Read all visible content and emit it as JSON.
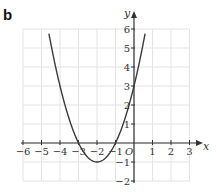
{
  "panel": {
    "label": "b"
  },
  "chart_data": {
    "type": "line",
    "title": "",
    "xlabel": "x",
    "ylabel": "y",
    "origin_label": "O",
    "xlim": [
      -6,
      3
    ],
    "ylim": [
      -2,
      6
    ],
    "grid": true,
    "x_ticks": [
      -6,
      -5,
      -4,
      -3,
      -2,
      -1,
      1,
      2,
      3
    ],
    "x_tick_labels": [
      "−6",
      "−5",
      "−4",
      "−3",
      "−2",
      "−1",
      "1",
      "2",
      "3"
    ],
    "y_ticks": [
      -2,
      -1,
      1,
      2,
      3,
      4,
      5,
      6
    ],
    "y_tick_labels": [
      "−2",
      "−1",
      "1",
      "2",
      "3",
      "4",
      "5",
      "6"
    ],
    "series": [
      {
        "name": "y = x² + 4x + 3",
        "expression": "x^2 + 4x + 3",
        "x_range": [
          -4.6,
          0.6
        ],
        "points": [
          [
            -4.6,
            5.76
          ],
          [
            -4.5,
            5.25
          ],
          [
            -4,
            3
          ],
          [
            -3.5,
            1.25
          ],
          [
            -3,
            0
          ],
          [
            -2.5,
            -0.75
          ],
          [
            -2,
            -1
          ],
          [
            -1.5,
            -0.75
          ],
          [
            -1,
            0
          ],
          [
            -0.5,
            1.25
          ],
          [
            0,
            3
          ],
          [
            0.5,
            5.25
          ],
          [
            0.6,
            5.76
          ]
        ],
        "roots": [
          -3,
          -1
        ],
        "vertex": [
          -2,
          -1
        ],
        "y_intercept": 3
      }
    ]
  },
  "colors": {
    "curve": "#3a3a3a",
    "axis": "#333333",
    "grid": "#e3e3e3"
  }
}
